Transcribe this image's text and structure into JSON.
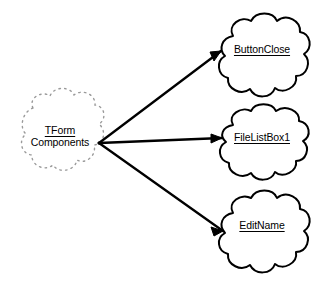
{
  "diagram": {
    "background_color": "#ffffff",
    "line_color": "#000000",
    "source_outline_color": "#9a9a9a",
    "source_node": {
      "id": "tform-components",
      "shape": "cloud-dashed",
      "line1": "TForm",
      "line2": "Components",
      "line1_underlined": true,
      "line2_underlined": false
    },
    "target_nodes": [
      {
        "id": "buttonclose",
        "shape": "cloud",
        "label": "ButtonClose",
        "underlined": true
      },
      {
        "id": "filelistbox1",
        "shape": "cloud",
        "label": "FileListBox1",
        "underlined": true
      },
      {
        "id": "editname",
        "shape": "cloud",
        "label": "EditName",
        "underlined": true
      }
    ],
    "connectors": [
      {
        "from": "tform-components",
        "to": "buttonclose",
        "arrowhead": "open"
      },
      {
        "from": "tform-components",
        "to": "filelistbox1",
        "arrowhead": "open"
      },
      {
        "from": "tform-components",
        "to": "editname",
        "arrowhead": "open"
      }
    ]
  }
}
